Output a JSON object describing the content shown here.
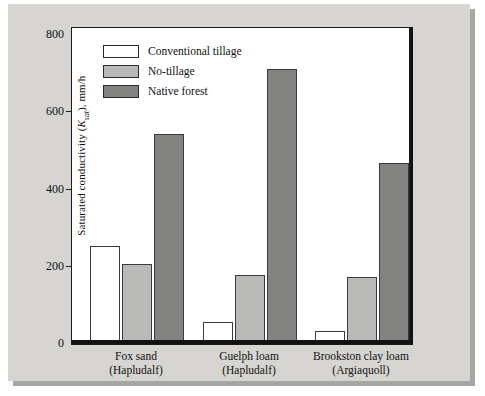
{
  "chart_data": {
    "type": "bar",
    "title": "",
    "xlabel": "",
    "ylabel": "Saturated conductivity (Ksat), mm/h",
    "ylabel_parts": {
      "prefix": "Saturated conductivity (",
      "symbol": "K",
      "subscript": "sat",
      "suffix": "), mm/h"
    },
    "ylim": [
      0,
      800
    ],
    "yticks": [
      0,
      200,
      400,
      600,
      800
    ],
    "ytick_labels": [
      "0",
      "200",
      "400",
      "600",
      "800"
    ],
    "grid": false,
    "legend_position": "top-left",
    "categories": [
      "Fox sand\n(Hapludalf)",
      "Guelph loam\n(Hapludalf)",
      "Brookston clay loam\n(Argiaquoll)"
    ],
    "category_labels": [
      {
        "line1": "Fox sand",
        "line2": "(Hapludalf)"
      },
      {
        "line1": "Guelph loam",
        "line2": "(Hapludalf)"
      },
      {
        "line1": "Brookston clay loam",
        "line2": "(Argiaquoll)"
      }
    ],
    "series": [
      {
        "name": "Conventional tillage",
        "color": "#ffffff",
        "values": [
          245,
          50,
          25
        ]
      },
      {
        "name": "No-tillage",
        "color": "#b9b9b7",
        "values": [
          200,
          170,
          165
        ]
      },
      {
        "name": "Native forest",
        "color": "#828281",
        "values": [
          535,
          703,
          460
        ]
      }
    ]
  },
  "legend": {
    "items": [
      {
        "label": "Conventional tillage"
      },
      {
        "label": "No-tillage"
      },
      {
        "label": "Native forest"
      }
    ]
  },
  "colors": {
    "panel_background": "#d6d5d1",
    "plot_background": "#ffffff",
    "axis": "#111111",
    "series_conventional": "#ffffff",
    "series_notillage": "#b9b9b7",
    "series_forest": "#828281"
  }
}
